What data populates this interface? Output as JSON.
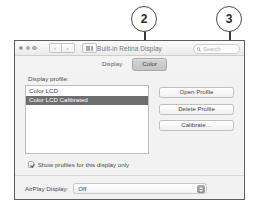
{
  "callouts": [
    {
      "number": "2"
    },
    {
      "number": "3"
    }
  ],
  "window": {
    "title": "Built-in Retina Display",
    "traffic_lights": [
      "close",
      "minimize",
      "zoom"
    ],
    "nav": {
      "back": "‹",
      "forward": "›"
    },
    "grid_button": "all-preferences-grid",
    "search": {
      "placeholder": "Search",
      "value": "",
      "icon": "search-icon"
    },
    "tabs": [
      {
        "label": "Display",
        "active": false
      },
      {
        "label": "Color",
        "active": true
      }
    ],
    "pane": {
      "profile_label": "Display profile:",
      "profiles": [
        {
          "name": "Color LCD",
          "selected": false
        },
        {
          "name": "Color LCD Calibrated",
          "selected": true
        }
      ],
      "buttons": [
        {
          "label": "Open Profile"
        },
        {
          "label": "Delete Profile"
        },
        {
          "label": "Calibrate…"
        }
      ],
      "checkbox": {
        "label": "Show profiles for this display only",
        "checked": true
      }
    },
    "footer": {
      "airplay_label": "AirPlay Display:",
      "airplay_value": "Off",
      "mirroring_label": "Show mirroring options in the menu bar when available",
      "help_label": "?"
    }
  },
  "colors": {
    "window_bg": "#f2f2f2",
    "window_border": "#5d5d5d",
    "selection": "#6e6e6e",
    "callout_stroke": "#4a4a4a",
    "leader": "#3a3a3a"
  }
}
